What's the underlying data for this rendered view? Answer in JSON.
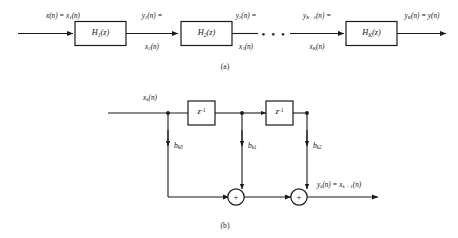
{
  "figure": {
    "caption_a": "(a)",
    "caption_b": "(b)",
    "ellipsis": "• • •"
  },
  "diagram_a": {
    "name": "cascade-of-second-order-sections",
    "input_label_top": "x(n) = x",
    "input_label_sub": "1",
    "input_label_tail": "(n)",
    "blocks": [
      {
        "base": "H",
        "sub": "1",
        "tail": "(z)"
      },
      {
        "base": "H",
        "sub": "2",
        "tail": "(z)"
      },
      {
        "base": "H",
        "sub": "K",
        "tail": "(z)"
      }
    ],
    "signals": [
      {
        "top_base": "y",
        "top_sub": "1",
        "top_tail": "(n) =",
        "bot_base": "x",
        "bot_sub": "2",
        "bot_tail": "(n)"
      },
      {
        "top_base": "y",
        "top_sub": "2",
        "top_tail": "(n) =",
        "bot_base": "x",
        "bot_sub": "3",
        "bot_tail": "(n)"
      },
      {
        "top_base": "y",
        "top_sub": "K - 1",
        "top_tail": "(n) =",
        "bot_base": "x",
        "bot_sub": "K",
        "bot_tail": "(n)"
      }
    ],
    "output_base": "y",
    "output_sub": "K",
    "output_tail": "(n) = y(n)"
  },
  "diagram_b": {
    "name": "direct-form-second-order-section",
    "input_base": "x",
    "input_sub": "k",
    "input_tail": "(n)",
    "delay_blocks": [
      {
        "base": "z",
        "exp": "-1"
      },
      {
        "base": "z",
        "exp": "-1"
      }
    ],
    "coefficients": [
      {
        "base": "b",
        "sub": "k0"
      },
      {
        "base": "b",
        "sub": "k1"
      },
      {
        "base": "b",
        "sub": "k2"
      }
    ],
    "adders": [
      {
        "symbol": "+"
      },
      {
        "symbol": "+"
      }
    ],
    "output_base": "y",
    "output_sub": "k",
    "output_mid": "(n) = x",
    "output_sub2": "k + 1",
    "output_tail": "(n)"
  },
  "colors": {
    "ink": "#1a1a1a",
    "paper": "#ffffff"
  }
}
